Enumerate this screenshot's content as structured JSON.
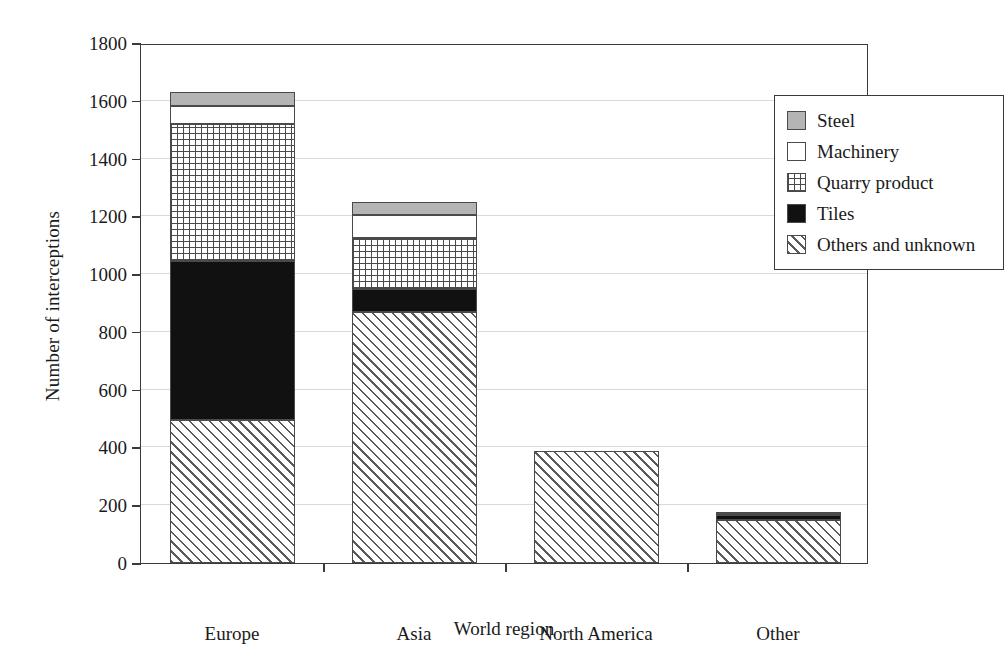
{
  "chart_data": {
    "type": "bar",
    "stacked": true,
    "title": "",
    "xlabel": "World region",
    "ylabel": "Number of interceptions",
    "categories": [
      "Europe",
      "Asia",
      "North America",
      "Other"
    ],
    "ylim": [
      0,
      1800
    ],
    "yticks": [
      0,
      200,
      400,
      600,
      800,
      1000,
      1200,
      1400,
      1600,
      1800
    ],
    "grid": true,
    "legend_position": "top-right",
    "series": [
      {
        "name": "Others and unknown",
        "pattern": "diagonal-hatch",
        "color": "#ffffff",
        "values": [
          495,
          869,
          388,
          149
        ]
      },
      {
        "name": "Tiles",
        "pattern": "solid-black",
        "color": "#111111",
        "values": [
          550,
          80,
          0,
          18
        ]
      },
      {
        "name": "Quarry product",
        "pattern": "grid-hatch",
        "color": "#ffffff",
        "values": [
          475,
          175,
          0,
          10
        ]
      },
      {
        "name": "Machinery",
        "pattern": "white-solid",
        "color": "#ffffff",
        "values": [
          62,
          80,
          0,
          0
        ]
      },
      {
        "name": "Steel",
        "pattern": "gray-solid",
        "color": "#b4b4b4",
        "values": [
          48,
          45,
          0,
          0
        ]
      }
    ],
    "totals": [
      1630,
      1249,
      388,
      177
    ]
  },
  "legend": {
    "items": [
      {
        "label": "Steel",
        "swatch": "gray-solid"
      },
      {
        "label": "Machinery",
        "swatch": "white-solid"
      },
      {
        "label": "Quarry product",
        "swatch": "grid-hatch"
      },
      {
        "label": "Tiles",
        "swatch": "solid-black"
      },
      {
        "label": "Others and unknown",
        "swatch": "diagonal-hatch"
      }
    ]
  },
  "axes": {
    "y_label": "Number of interceptions",
    "x_label": "World region",
    "y_tick_labels": [
      "0",
      "200",
      "400",
      "600",
      "800",
      "1000",
      "1200",
      "1400",
      "1600",
      "1800"
    ],
    "x_tick_labels": [
      "Europe",
      "Asia",
      "North America",
      "Other"
    ]
  },
  "colors": {
    "axis": "#3a3a3a",
    "grid": "#d9d9d9",
    "steel": "#b4b4b4",
    "tiles": "#111111",
    "hatch": "#5a5a5a"
  }
}
